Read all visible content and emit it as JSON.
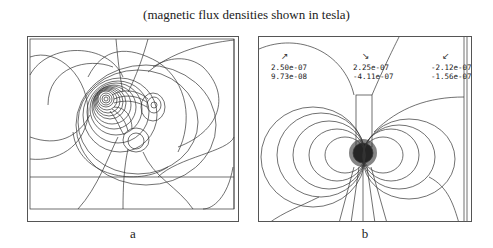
{
  "figure": {
    "caption": "(magnetic flux densities shown in tesla)",
    "panels": [
      {
        "id": "a",
        "label": "a",
        "description": "Flux line contour plot around three conductors"
      },
      {
        "id": "b",
        "label": "b",
        "description": "Flux line contour plot around single conductor near rectangular body",
        "readouts": [
          {
            "arrow": "↗",
            "value1": "2.50e-07",
            "value2": "9.73e-08"
          },
          {
            "arrow": "↘",
            "value1": "2.25e-07",
            "value2": "-4.11e-07"
          },
          {
            "arrow": "↙",
            "value1": "-2.12e-07",
            "value2": "-1.56e-07"
          }
        ]
      }
    ]
  }
}
